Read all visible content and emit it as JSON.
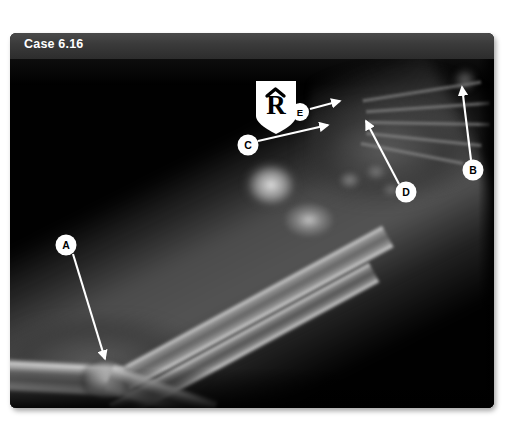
{
  "figure": {
    "caption": "Case 6.16",
    "modality": "radiograph",
    "body_part": "forearm",
    "view": "lateral / oblique",
    "background_color": "#000000",
    "caption_bar_color": "#3b3b3b",
    "caption_text_color": "#ffffff"
  },
  "side_marker": {
    "letter": "R",
    "caret": "^",
    "shape": "shield",
    "fill": "#ffffff",
    "text_color": "#000000"
  },
  "annotations": [
    {
      "id": "A",
      "label": "A",
      "circle": {
        "cx": 56,
        "cy": 186,
        "r": 10.5
      },
      "arrow": {
        "x1": 63,
        "y1": 195,
        "x2": 95,
        "y2": 300
      }
    },
    {
      "id": "B",
      "label": "B",
      "circle": {
        "cx": 463,
        "cy": 111,
        "r": 10.5
      },
      "arrow": {
        "x1": 461,
        "y1": 101,
        "x2": 452,
        "y2": 28
      }
    },
    {
      "id": "C",
      "label": "C",
      "circle": {
        "cx": 238,
        "cy": 86,
        "r": 10.5
      },
      "arrow": {
        "x1": 248,
        "y1": 82,
        "x2": 318,
        "y2": 66
      }
    },
    {
      "id": "D",
      "label": "D",
      "circle": {
        "cx": 396,
        "cy": 133,
        "r": 10.5
      },
      "arrow": {
        "x1": 389,
        "y1": 125,
        "x2": 356,
        "y2": 62
      }
    },
    {
      "id": "E",
      "label": "E",
      "circle": {
        "cx": 290,
        "cy": 53,
        "r": 9
      },
      "arrow": {
        "x1": 300,
        "y1": 50,
        "x2": 330,
        "y2": 42
      }
    }
  ]
}
